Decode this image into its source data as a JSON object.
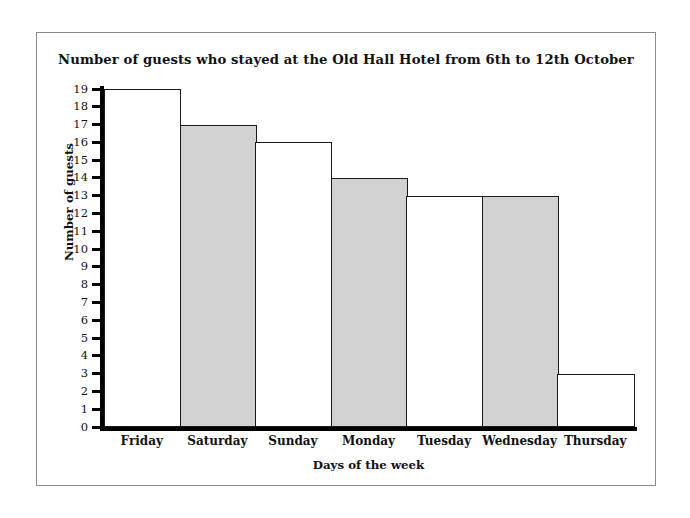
{
  "chart_data": {
    "type": "bar",
    "title": "Number of guests who stayed at the Old Hall Hotel from 6th to 12th October",
    "xlabel": "Days of the week",
    "ylabel": "Number of guests",
    "categories": [
      "Friday",
      "Saturday",
      "Sunday",
      "Monday",
      "Tuesday",
      "Wednesday",
      "Thursday"
    ],
    "values": [
      19,
      17,
      16,
      14,
      13,
      13,
      3
    ],
    "bar_fills": [
      "white",
      "gray",
      "white",
      "gray",
      "white",
      "gray",
      "white"
    ],
    "ylim": [
      0,
      19
    ],
    "ytick_labels": [
      "19",
      "18",
      "17",
      "16",
      "15",
      "14",
      "13",
      "12",
      "11",
      "10",
      "9",
      "8",
      "7",
      "6",
      "5",
      "4",
      "3",
      "2",
      "1",
      "0"
    ],
    "ytick_values": [
      19,
      18,
      17,
      16,
      15,
      14,
      13,
      12,
      11,
      10,
      9,
      8,
      7,
      6,
      5,
      4,
      3,
      2,
      1,
      0
    ],
    "ytick_step": 1,
    "grid": false,
    "legend": null,
    "bars_contiguous": true,
    "colors": {
      "bar_gray_fill": "#d2d2d2",
      "bar_white_fill": "#ffffff",
      "bar_outline": "#1a1a1a",
      "axis": "#000000",
      "text": "#111111",
      "frame_border": "#8a8a8a",
      "background": "#ffffff"
    }
  }
}
